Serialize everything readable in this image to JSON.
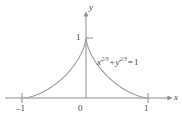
{
  "figure": {
    "background_color": "#ffffff",
    "axis_color": "#8c8c8c",
    "curve_color": "#9a9a9a",
    "text_color": "#3f3f3f",
    "y_axis_name": "y",
    "x_axis_name": "x",
    "equation": {
      "lhs_var_1": "x",
      "lhs_exp_1": "2/3",
      "plus": "+",
      "lhs_var_2": "y",
      "lhs_exp_2": "2/3",
      "equals": "=",
      "rhs": "1",
      "full_text": "x^(2/3) + y^(2/3) = 1"
    },
    "tick_labels": {
      "x_neg_one": "–1",
      "origin": "0",
      "x_one": "1",
      "y_one": "1"
    }
  },
  "chart_data": {
    "type": "line",
    "title": "",
    "subtitle": "",
    "xlabel": "x",
    "ylabel": "y",
    "xlim": [
      -1.35,
      1.45
    ],
    "ylim": [
      -0.18,
      1.38
    ],
    "xticks": [
      -1,
      0,
      1
    ],
    "xticklabels": [
      "–1",
      "0",
      "1"
    ],
    "yticks": [
      1
    ],
    "yticklabels": [
      "1"
    ],
    "grid": false,
    "legend": null,
    "annotations": [
      {
        "text": "x^(2/3) + y^(2/3) = 1",
        "x": 0.22,
        "y": 0.62
      }
    ],
    "series": [
      {
        "name": "astroid upper branch: y = (1 - |x|^(2/3))^(3/2)",
        "x": [
          -1.0,
          -0.98,
          -0.95,
          -0.9,
          -0.85,
          -0.8,
          -0.75,
          -0.7,
          -0.65,
          -0.6,
          -0.55,
          -0.5,
          -0.45,
          -0.4,
          -0.35,
          -0.3,
          -0.25,
          -0.2,
          -0.15,
          -0.1,
          -0.07,
          -0.05,
          -0.03,
          -0.02,
          -0.01,
          0.0,
          0.01,
          0.02,
          0.03,
          0.05,
          0.07,
          0.1,
          0.15,
          0.2,
          0.25,
          0.3,
          0.35,
          0.4,
          0.45,
          0.5,
          0.55,
          0.6,
          0.65,
          0.7,
          0.75,
          0.8,
          0.85,
          0.9,
          0.95,
          0.98,
          1.0
        ],
        "y": [
          0.0,
          0.0027,
          0.0106,
          0.0359,
          0.0688,
          0.1076,
          0.1515,
          0.1998,
          0.2522,
          0.3084,
          0.3684,
          0.4319,
          0.4991,
          0.5699,
          0.6443,
          0.7226,
          0.8047,
          0.891,
          0.9816,
          1.0769,
          1.1368,
          1.1784,
          1.222,
          1.245,
          1.269,
          1.0,
          1.269,
          1.245,
          1.222,
          1.1784,
          1.1368,
          1.0769,
          0.9816,
          0.891,
          0.8047,
          0.7226,
          0.6443,
          0.5699,
          0.4991,
          0.4319,
          0.3684,
          0.3084,
          0.2522,
          0.1998,
          0.1515,
          0.1076,
          0.0688,
          0.0359,
          0.0106,
          0.0027,
          0.0
        ]
      }
    ]
  }
}
